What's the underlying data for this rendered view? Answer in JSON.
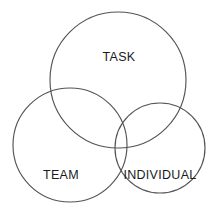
{
  "diagram": {
    "type": "venn",
    "background_color": "#ffffff",
    "stroke_color": "#545454",
    "label_color": "#1a1a1a",
    "canvas": {
      "width": 212,
      "height": 217
    },
    "circles": [
      {
        "key": "task",
        "label": "TASK",
        "cx": 118,
        "cy": 80,
        "r": 68,
        "label_x": 119,
        "label_y": 58
      },
      {
        "key": "team",
        "label": "TEAM",
        "cx": 70,
        "cy": 145,
        "r": 57,
        "label_x": 61,
        "label_y": 176
      },
      {
        "key": "individual",
        "label": "INDIVIDUAL",
        "cx": 160,
        "cy": 148,
        "r": 45,
        "label_x": 160,
        "label_y": 176
      }
    ]
  }
}
